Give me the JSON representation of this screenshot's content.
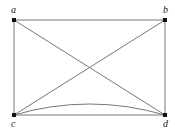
{
  "graph": {
    "vertices": [
      {
        "id": "a",
        "label": "a",
        "x": 14,
        "y": 20,
        "lx": 11,
        "ly": 13
      },
      {
        "id": "b",
        "label": "b",
        "x": 165,
        "y": 20,
        "lx": 163,
        "ly": 13
      },
      {
        "id": "c",
        "label": "c",
        "x": 14,
        "y": 115,
        "lx": 11,
        "ly": 127
      },
      {
        "id": "d",
        "label": "d",
        "x": 165,
        "y": 115,
        "lx": 163,
        "ly": 127
      }
    ],
    "edges": [
      {
        "from": "a",
        "to": "b",
        "type": "straight"
      },
      {
        "from": "a",
        "to": "c",
        "type": "straight"
      },
      {
        "from": "b",
        "to": "d",
        "type": "straight"
      },
      {
        "from": "c",
        "to": "d",
        "type": "straight"
      },
      {
        "from": "c",
        "to": "d",
        "type": "curved"
      },
      {
        "from": "a",
        "to": "d",
        "type": "straight"
      },
      {
        "from": "b",
        "to": "c",
        "type": "straight"
      }
    ]
  }
}
